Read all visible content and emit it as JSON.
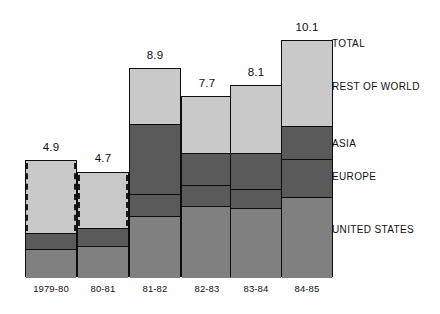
{
  "chart_data": {
    "type": "bar",
    "subtype": "stacked-bar",
    "title": "",
    "xlabel": "",
    "ylabel": "",
    "ylim": [
      0,
      11.6
    ],
    "grid": false,
    "legend_position": "right",
    "categories": [
      "1979-80",
      "80-81",
      "81-82",
      "82-83",
      "83-84",
      "84-85"
    ],
    "totals": [
      4.9,
      4.7,
      8.9,
      7.7,
      8.1,
      10.1
    ],
    "series": [
      {
        "name": "UNITED STATES",
        "color": "#808080",
        "values": [
          1.4,
          1.5,
          3.0,
          3.4,
          3.3,
          3.7
        ]
      },
      {
        "name": "EUROPE",
        "color": "#5a5a5a",
        "values": [
          0.7,
          0.8,
          1.0,
          1.0,
          0.9,
          1.4
        ]
      },
      {
        "name": "ASIA",
        "color": "#5a5a5a",
        "values": [
          0.0,
          0.0,
          2.3,
          1.1,
          1.6,
          1.3
        ]
      },
      {
        "name": "REST OF WORLD",
        "color": "#c9c9c9",
        "values": [
          2.8,
          2.4,
          2.6,
          2.2,
          2.3,
          3.7
        ]
      }
    ],
    "annotations": [
      "1979-80 and 80-81 bars drawn with dashed inner outline (estimated)"
    ]
  },
  "legend": {
    "items": [
      {
        "label": "TOTAL"
      },
      {
        "label": "REST OF WORLD"
      },
      {
        "label": "ASIA"
      },
      {
        "label": "EUROPE"
      },
      {
        "label": "UNITED STATES"
      }
    ]
  },
  "bars": [
    {
      "category": "1979-80",
      "total_label": "4.9",
      "dashed": true,
      "segments": [
        {
          "name": "rest-of-world",
          "color": "#c9c9c9"
        },
        {
          "name": "europe",
          "color": "#5a5a5a"
        },
        {
          "name": "united-states",
          "color": "#808080"
        }
      ]
    },
    {
      "category": "80-81",
      "total_label": "4.7",
      "dashed": true,
      "segments": [
        {
          "name": "rest-of-world",
          "color": "#c9c9c9"
        },
        {
          "name": "europe",
          "color": "#5a5a5a"
        },
        {
          "name": "united-states",
          "color": "#808080"
        }
      ]
    },
    {
      "category": "81-82",
      "total_label": "8.9",
      "dashed": false,
      "segments": [
        {
          "name": "rest-of-world",
          "color": "#c9c9c9"
        },
        {
          "name": "asia",
          "color": "#5a5a5a"
        },
        {
          "name": "europe",
          "color": "#5a5a5a"
        },
        {
          "name": "united-states",
          "color": "#808080"
        }
      ]
    },
    {
      "category": "82-83",
      "total_label": "7.7",
      "dashed": false,
      "segments": [
        {
          "name": "rest-of-world",
          "color": "#c9c9c9"
        },
        {
          "name": "asia",
          "color": "#5a5a5a"
        },
        {
          "name": "europe",
          "color": "#5a5a5a"
        },
        {
          "name": "united-states",
          "color": "#808080"
        }
      ]
    },
    {
      "category": "83-84",
      "total_label": "8.1",
      "dashed": false,
      "segments": [
        {
          "name": "rest-of-world",
          "color": "#c9c9c9"
        },
        {
          "name": "asia",
          "color": "#5a5a5a"
        },
        {
          "name": "europe",
          "color": "#5a5a5a"
        },
        {
          "name": "united-states",
          "color": "#808080"
        }
      ]
    },
    {
      "category": "84-85",
      "total_label": "10.1",
      "dashed": false,
      "segments": [
        {
          "name": "rest-of-world",
          "color": "#c9c9c9"
        },
        {
          "name": "asia",
          "color": "#5a5a5a"
        },
        {
          "name": "europe",
          "color": "#5a5a5a"
        },
        {
          "name": "united-states",
          "color": "#808080"
        }
      ]
    }
  ],
  "geometry": {
    "baseline_y": 277,
    "bar_width": 52,
    "bar_x": [
      25,
      77,
      129,
      181,
      230,
      281
    ],
    "bar_top_y": [
      160,
      172,
      68,
      96,
      85,
      40
    ],
    "segment_boundaries": [
      [
        232,
        248
      ],
      [
        227,
        245
      ],
      [
        123,
        193,
        215
      ],
      [
        152,
        184,
        205
      ],
      [
        152,
        188,
        207
      ],
      [
        125,
        158,
        196
      ]
    ],
    "value_label_y": [
      141,
      152,
      49,
      77,
      66,
      21
    ],
    "cat_label_y": 283,
    "legend_x": 332,
    "legend_y": [
      38,
      81,
      138,
      171,
      224
    ]
  }
}
